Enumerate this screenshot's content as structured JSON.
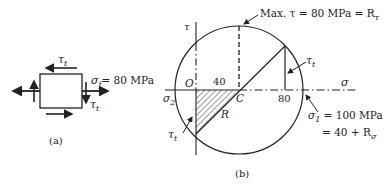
{
  "figure_a": {
    "caption": "(a)",
    "shear_label_top": "τ",
    "shear_sub_top": "t",
    "normal_label": "σ",
    "normal_sub": "f",
    "normal_value": "= 80 MPa",
    "shear_label_right": "τ",
    "shear_sub_right": "t"
  },
  "figure_b": {
    "caption": "(b)",
    "tau_axis_label": "τ",
    "sigma_axis_label": "σ",
    "origin_label": "O",
    "center_label": "C",
    "radius_label": "R",
    "sigma2_label": "σ",
    "sigma2_sub": "2",
    "tick_40": "40",
    "tick_80": "80",
    "max_tau_note": "Max. τ = 80 MPa = R",
    "max_tau_sub": "τ",
    "tau_t_right": "τ",
    "tau_t_right_sub": "t",
    "tau_t_left": "τ",
    "tau_t_left_sub": "t",
    "sigma1_line1": "σ",
    "sigma1_sub": "1",
    "sigma1_value": " = 100 MPa",
    "sigma1_line2": "= 40 + R",
    "sigma1_line2_sub": "σ"
  },
  "colors": {
    "ink": "#222222",
    "background": "#ffffff"
  }
}
